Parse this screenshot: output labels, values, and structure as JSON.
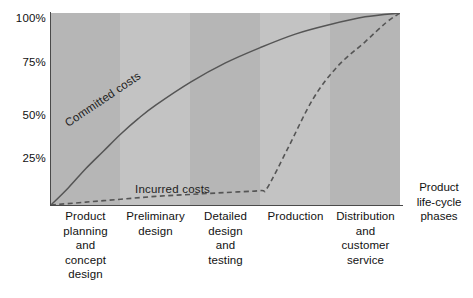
{
  "chart_data": {
    "type": "line",
    "title": "",
    "xlabel": "Product life-cycle phases",
    "ylabel": "",
    "ylim": [
      0,
      100
    ],
    "ytick_labels": [
      "100%",
      "75%",
      "50%",
      "25%"
    ],
    "ytick_values": [
      100,
      75,
      50,
      25
    ],
    "grid": false,
    "legend": "inline-annotations",
    "categories": [
      "Product planning and concept design",
      "Preliminary design",
      "Detailed design and testing",
      "Production",
      "Distribution and customer service"
    ],
    "series": [
      {
        "name": "Committed costs",
        "style": "solid",
        "color": "#555555",
        "x": [
          0,
          5,
          10,
          15,
          20,
          25,
          30,
          40,
          50,
          60,
          70,
          80,
          90,
          100
        ],
        "values": [
          0,
          9,
          19,
          28,
          37,
          45,
          52,
          64,
          74,
          82,
          89,
          94,
          98,
          100
        ]
      },
      {
        "name": "Incurred costs",
        "style": "dashed",
        "color": "#555555",
        "x": [
          0,
          10,
          20,
          30,
          40,
          50,
          60,
          62,
          68,
          75,
          82,
          90,
          96,
          100
        ],
        "values": [
          0,
          1.5,
          3,
          4.5,
          5.5,
          6.5,
          7.5,
          9,
          30,
          55,
          72,
          85,
          95,
          100
        ]
      }
    ],
    "bands": [
      {
        "label": "Product planning and concept design",
        "shade": "#b6b6b6"
      },
      {
        "label": "Preliminary design",
        "shade": "#c3c3c3"
      },
      {
        "label": "Detailed design and testing",
        "shade": "#b6b6b6"
      },
      {
        "label": "Production",
        "shade": "#c3c3c3"
      },
      {
        "label": "Distribution and customer service",
        "shade": "#b6b6b6"
      }
    ]
  },
  "axes": {
    "y_ticks": [
      {
        "label": "100%",
        "value": 100
      },
      {
        "label": "75%",
        "value": 75
      },
      {
        "label": "50%",
        "value": 50
      },
      {
        "label": "25%",
        "value": 25
      }
    ],
    "x_axis_label_lines": [
      "Product",
      "life-cycle",
      "phases"
    ]
  },
  "annotations": {
    "committed_costs": "Committed costs",
    "incurred_costs": "Incurred costs"
  },
  "phases": [
    {
      "lines": [
        "Product",
        "planning",
        "and",
        "concept",
        "design"
      ]
    },
    {
      "lines": [
        "Preliminary",
        "design"
      ]
    },
    {
      "lines": [
        "Detailed",
        "design",
        "and",
        "testing"
      ]
    },
    {
      "lines": [
        "Production"
      ]
    },
    {
      "lines": [
        "Distribution",
        "and",
        "customer",
        "service"
      ]
    }
  ],
  "colors": {
    "band_dark": "#b6b6b6",
    "band_light": "#c3c3c3",
    "axis": "#4a4a4a",
    "curve": "#555555",
    "text": "#111111",
    "background": "#ffffff"
  }
}
